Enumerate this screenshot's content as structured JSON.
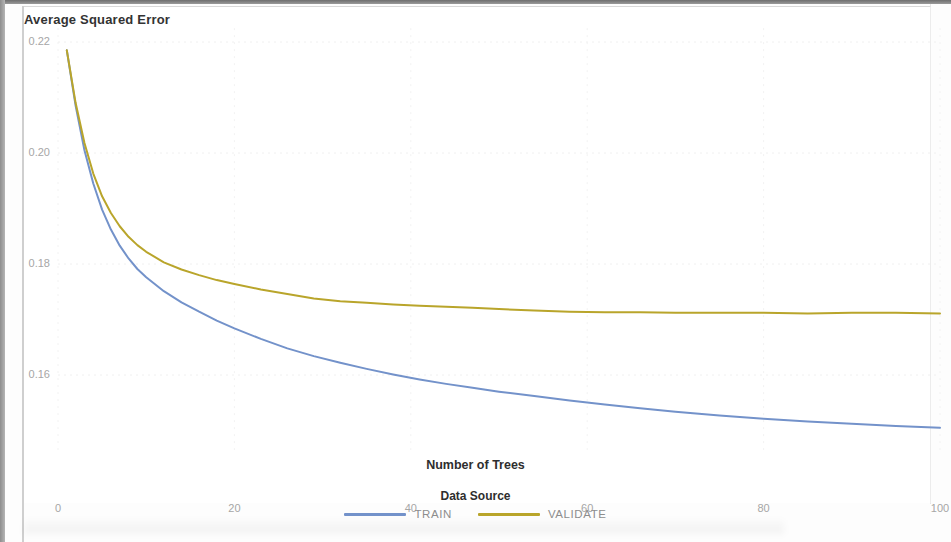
{
  "chart_data": {
    "type": "line",
    "title": "Average Squared Error",
    "xlabel": "Number of Trees",
    "ylabel": "",
    "xlim": [
      0,
      100
    ],
    "ylim": [
      0.1465,
      0.2225
    ],
    "xticks": [
      0,
      20,
      40,
      60,
      80,
      100
    ],
    "xtick_labels": [
      "0",
      "20",
      "40",
      "60",
      "80",
      "100"
    ],
    "yticks": [
      0.16,
      0.18,
      0.2,
      0.22
    ],
    "ytick_labels": [
      "0.16",
      "0.18",
      "0.20",
      "0.22"
    ],
    "grid": true,
    "legend_title": "Data Source",
    "legend_position": "bottom",
    "series": [
      {
        "name": "TRAIN",
        "color": "#7392ca",
        "x": [
          1,
          2,
          3,
          4,
          5,
          6,
          7,
          8,
          9,
          10,
          12,
          14,
          16,
          18,
          20,
          23,
          26,
          29,
          32,
          35,
          38,
          41,
          44,
          47,
          50,
          54,
          58,
          62,
          66,
          70,
          75,
          80,
          85,
          90,
          95,
          100
        ],
        "values": [
          0.2185,
          0.2085,
          0.2005,
          0.1945,
          0.1898,
          0.1862,
          0.1833,
          0.181,
          0.1791,
          0.1776,
          0.1751,
          0.1731,
          0.1714,
          0.1698,
          0.1684,
          0.1665,
          0.1648,
          0.1634,
          0.1622,
          0.1611,
          0.1601,
          0.1592,
          0.1584,
          0.1577,
          0.157,
          0.1562,
          0.1554,
          0.1547,
          0.154,
          0.1534,
          0.1527,
          0.1521,
          0.1516,
          0.1512,
          0.1508,
          0.1505
        ]
      },
      {
        "name": "VALIDATE",
        "color": "#b9a52b",
        "x": [
          1,
          2,
          3,
          4,
          5,
          6,
          7,
          8,
          9,
          10,
          12,
          14,
          16,
          18,
          20,
          23,
          26,
          29,
          32,
          35,
          38,
          41,
          44,
          47,
          50,
          54,
          58,
          62,
          66,
          70,
          75,
          80,
          85,
          90,
          95,
          100
        ],
        "values": [
          0.2185,
          0.209,
          0.2018,
          0.1963,
          0.1922,
          0.1892,
          0.1868,
          0.1849,
          0.1834,
          0.1822,
          0.1803,
          0.179,
          0.178,
          0.1771,
          0.1764,
          0.1754,
          0.1746,
          0.1738,
          0.1733,
          0.173,
          0.1727,
          0.1725,
          0.1723,
          0.1721,
          0.1719,
          0.1716,
          0.1714,
          0.1713,
          0.1713,
          0.1712,
          0.1712,
          0.1712,
          0.1711,
          0.1712,
          0.1712,
          0.1711
        ]
      }
    ]
  },
  "legend": {
    "title": "Data Source",
    "items": [
      {
        "label": "TRAIN",
        "color": "#7392ca"
      },
      {
        "label": "VALIDATE",
        "color": "#b9a52b"
      }
    ]
  },
  "axes": {
    "x_label": "Number of Trees"
  }
}
